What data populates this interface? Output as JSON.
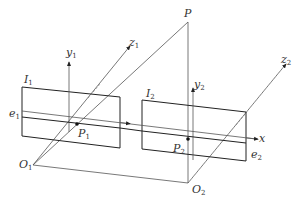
{
  "diagram": {
    "type": "stereo-epipolar-geometry",
    "labels": {
      "P": {
        "base": "P",
        "sub": ""
      },
      "y1": {
        "base": "y",
        "sub": "1"
      },
      "z1": {
        "base": "z",
        "sub": "1"
      },
      "I1": {
        "base": "I",
        "sub": "1"
      },
      "e1": {
        "base": "e",
        "sub": "1"
      },
      "P1": {
        "base": "P",
        "sub": "1"
      },
      "O1": {
        "base": "O",
        "sub": "1"
      },
      "y2": {
        "base": "y",
        "sub": "2"
      },
      "z2": {
        "base": "z",
        "sub": "2"
      },
      "I2": {
        "base": "I",
        "sub": "2"
      },
      "e2": {
        "base": "e",
        "sub": "2"
      },
      "P2": {
        "base": "P",
        "sub": "2"
      },
      "O2": {
        "base": "O",
        "sub": "2"
      },
      "x": {
        "base": "x",
        "sub": ""
      }
    },
    "colors": {
      "line": "#333333",
      "thin": "#555555",
      "background": "#ffffff"
    }
  }
}
